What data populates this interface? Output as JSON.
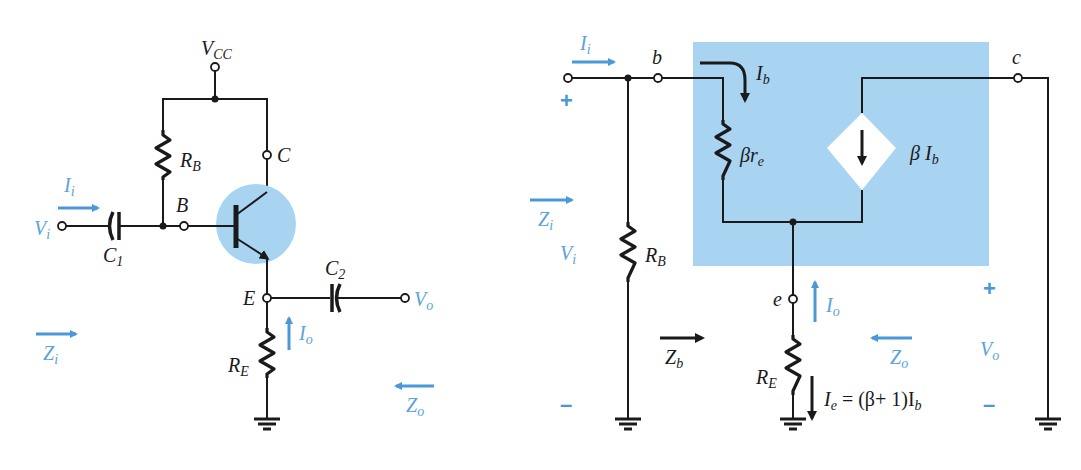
{
  "colors": {
    "wire": "#1a1a1a",
    "accent_blue": "#4a98d8",
    "highlight_fill": "#a8d4f2",
    "background": "#ffffff"
  },
  "left_circuit": {
    "supply": {
      "main": "V",
      "sub": "CC"
    },
    "resistor_base": {
      "main": "R",
      "sub": "B"
    },
    "resistor_emitter": {
      "main": "R",
      "sub": "E"
    },
    "cap_in": {
      "main": "C",
      "sub": "1"
    },
    "cap_out": {
      "main": "C",
      "sub": "2"
    },
    "node_base": "B",
    "node_collector": "C",
    "node_emitter": "E",
    "input_voltage": {
      "main": "V",
      "sub": "i"
    },
    "output_voltage": {
      "main": "V",
      "sub": "o"
    },
    "input_current": {
      "main": "I",
      "sub": "i"
    },
    "output_current": {
      "main": "I",
      "sub": "o"
    },
    "input_impedance": {
      "main": "Z",
      "sub": "i"
    },
    "output_impedance": {
      "main": "Z",
      "sub": "o"
    }
  },
  "right_circuit": {
    "node_b": "b",
    "node_c": "c",
    "node_e": "e",
    "input_current": {
      "main": "I",
      "sub": "i"
    },
    "base_current": {
      "main": "I",
      "sub": "b"
    },
    "internal_resistance": {
      "main": "βr",
      "sub": "e"
    },
    "dependent_source": {
      "main": "β I",
      "sub": "b"
    },
    "resistor_base": {
      "main": "R",
      "sub": "B"
    },
    "resistor_emitter": {
      "main": "R",
      "sub": "E"
    },
    "input_impedance": {
      "main": "Z",
      "sub": "i"
    },
    "input_voltage": {
      "main": "V",
      "sub": "i"
    },
    "base_impedance": {
      "main": "Z",
      "sub": "b"
    },
    "output_current": {
      "main": "I",
      "sub": "o"
    },
    "output_impedance": {
      "main": "Z",
      "sub": "o"
    },
    "output_voltage": {
      "main": "V",
      "sub": "o"
    },
    "emitter_current_eq": {
      "lhs": "I",
      "lhs_sub": "e",
      "rhs": " = (β+ 1)I",
      "rhs_sub": "b"
    },
    "plus_sign": "+",
    "minus_sign": "–"
  }
}
